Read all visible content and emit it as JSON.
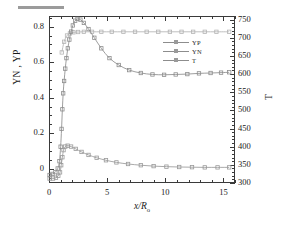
{
  "chart_data": {
    "type": "line",
    "title": "",
    "xlabel": "x/R",
    "xlabel_sub": "o",
    "ylabel_left": "YN , YP",
    "ylabel_right": "T",
    "xlim": [
      0,
      16
    ],
    "ylim_left": [
      -0.08,
      0.86
    ],
    "ylim_right": [
      300,
      760
    ],
    "xticks": [
      0,
      5,
      10,
      15
    ],
    "xticklabels": [
      "0",
      "5",
      "10",
      "15"
    ],
    "yticks_left": [
      0,
      0.2,
      0.4,
      0.6,
      0.8
    ],
    "yticklabels_left": [
      "0",
      "0.2",
      "0.4",
      "0.6",
      "0.8"
    ],
    "yticks_right": [
      300,
      350,
      400,
      450,
      500,
      550,
      600,
      650,
      700,
      750
    ],
    "yticklabels_right": [
      "300",
      "350",
      "400",
      "450",
      "500",
      "550",
      "600",
      "650",
      "700",
      "750"
    ],
    "minor_ticks": true,
    "grid": false,
    "legend_position": "center",
    "series": [
      {
        "name": "YP",
        "axis": "left",
        "color": "#9a9a9a",
        "marker": "square-open",
        "x": [
          0.05,
          0.35,
          0.6,
          0.8,
          0.95,
          1.05,
          1.15,
          1.25,
          1.4,
          1.6,
          1.9,
          2.3,
          2.8,
          3.4,
          4.1,
          4.9,
          5.8,
          6.8,
          7.9,
          9.0,
          10.1,
          11.2,
          12.3,
          13.4,
          14.5,
          15.5
        ],
        "y": [
          -0.055,
          -0.055,
          -0.05,
          -0.04,
          -0.02,
          0.02,
          0.065,
          0.105,
          0.125,
          0.13,
          0.125,
          0.112,
          0.095,
          0.078,
          0.062,
          0.048,
          0.036,
          0.027,
          0.02,
          0.015,
          0.012,
          0.01,
          0.009,
          0.008,
          0.008,
          0.008
        ]
      },
      {
        "name": "YN",
        "axis": "left",
        "color": "#b4b4b4",
        "marker": "square-open",
        "x": [
          1.1,
          1.3,
          1.55,
          1.8,
          2.1,
          2.5,
          3.0,
          3.7,
          4.5,
          5.4,
          6.4,
          7.4,
          8.4,
          9.4,
          10.4,
          11.4,
          12.4,
          13.4,
          14.4,
          15.5
        ],
        "y": [
          0.655,
          0.715,
          0.75,
          0.762,
          0.768,
          0.77,
          0.771,
          0.771,
          0.771,
          0.771,
          0.771,
          0.771,
          0.771,
          0.771,
          0.771,
          0.771,
          0.771,
          0.771,
          0.771,
          0.771
        ]
      },
      {
        "name": "T",
        "axis": "right",
        "color": "#8d8d8d",
        "marker": "square-open",
        "x": [
          0.05,
          0.3,
          0.55,
          0.75,
          0.9,
          1.0,
          1.08,
          1.15,
          1.22,
          1.3,
          1.4,
          1.5,
          1.62,
          1.75,
          1.9,
          2.05,
          2.25,
          2.45,
          2.7,
          3.0,
          3.4,
          3.9,
          4.5,
          5.2,
          6.0,
          6.9,
          7.9,
          8.9,
          9.9,
          10.9,
          11.9,
          12.9,
          13.9,
          14.8,
          15.5
        ],
        "y_left_scale": [
          -0.055,
          -0.05,
          -0.04,
          -0.02,
          0.02,
          0.1,
          0.2,
          0.31,
          0.4,
          0.47,
          0.54,
          0.6,
          0.655,
          0.705,
          0.75,
          0.785,
          0.812,
          0.822,
          0.818,
          0.8,
          0.765,
          0.715,
          0.655,
          0.6,
          0.56,
          0.532,
          0.515,
          0.506,
          0.504,
          0.506,
          0.509,
          0.512,
          0.515,
          0.517,
          0.519
        ],
        "y": [
          322,
          325,
          330,
          340,
          360,
          400,
          449,
          503,
          547,
          581,
          615,
          644,
          671,
          695,
          717,
          734,
          747,
          752,
          750,
          741,
          724,
          700,
          671,
          644,
          625,
          611,
          603,
          599,
          598,
          599,
          600,
          602,
          603,
          604,
          605
        ]
      }
    ]
  },
  "legend": {
    "items": [
      {
        "label": "YP"
      },
      {
        "label": "YN"
      },
      {
        "label": "T"
      }
    ]
  }
}
